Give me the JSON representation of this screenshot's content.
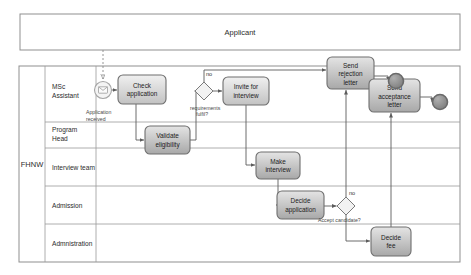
{
  "diagram": {
    "type": "bpmn-collaboration"
  },
  "pools": [
    {
      "id": "applicant",
      "label": "Applicant",
      "x": 20,
      "y": 14,
      "w": 440,
      "h": 36
    },
    {
      "id": "fhnw",
      "label": "FHNW",
      "x": 19,
      "y": 66,
      "w": 441,
      "h": 196
    }
  ],
  "lanes": [
    {
      "id": "msc-assistant",
      "label": "MSc\nAssistant",
      "label_lines": [
        "MSc",
        "Assistant"
      ],
      "y": 66,
      "h": 56
    },
    {
      "id": "program-head",
      "label": "Program\nHead",
      "label_lines": [
        "Program",
        "Head"
      ],
      "y": 122,
      "h": 26
    },
    {
      "id": "interview-team",
      "label": "Interview team",
      "label_lines": [
        "Interview team"
      ],
      "y": 148,
      "h": 38
    },
    {
      "id": "admission",
      "label": "Admission",
      "label_lines": [
        "Admission"
      ],
      "y": 186,
      "h": 38
    },
    {
      "id": "administration",
      "label": "Admnistration",
      "label_lines": [
        "Admnistration"
      ],
      "y": 224,
      "h": 38
    }
  ],
  "events": [
    {
      "id": "application-received",
      "kind": "message-start-event",
      "label": "Application\nreceived",
      "label_lines": [
        "Application",
        "received"
      ],
      "cx": 103,
      "cy": 90,
      "r": 8.5
    },
    {
      "id": "end-rejection",
      "kind": "end-event",
      "label": "",
      "cx": 396,
      "cy": 81,
      "r": 7.5,
      "fill": "#8a8a8a"
    },
    {
      "id": "end-acceptance",
      "kind": "end-event",
      "label": "",
      "cx": 440,
      "cy": 102,
      "r": 7.5,
      "fill": "#8a8a8a"
    }
  ],
  "tasks": [
    {
      "id": "check-application",
      "label_lines": [
        "Check",
        "application"
      ],
      "x": 118,
      "y": 75,
      "w": 48,
      "h": 29,
      "fill": "#dcdcdc"
    },
    {
      "id": "validate-eligibility",
      "label_lines": [
        "Validate",
        "eligibility"
      ],
      "x": 145,
      "y": 126,
      "w": 45,
      "h": 28,
      "fill": "#c9c9c9"
    },
    {
      "id": "invite-for-interview",
      "label_lines": [
        "Invite for",
        "interview"
      ],
      "x": 223,
      "y": 77,
      "w": 46,
      "h": 28,
      "fill": "#dcdcdc"
    },
    {
      "id": "make-interview",
      "label_lines": [
        "Make",
        "interview"
      ],
      "x": 256,
      "y": 152,
      "w": 44,
      "h": 27,
      "fill": "#cfcfcf"
    },
    {
      "id": "decide-application",
      "label_lines": [
        "Decide",
        "application"
      ],
      "x": 277,
      "y": 191,
      "w": 47,
      "h": 28,
      "fill": "#b9b9b9"
    },
    {
      "id": "send-rejection-letter",
      "label_lines": [
        "Send",
        "rejection",
        "letter"
      ],
      "x": 327,
      "y": 57,
      "w": 47,
      "h": 32,
      "fill": "#c4c4c4"
    },
    {
      "id": "send-acceptance-letter",
      "label_lines": [
        "Send",
        "acceptance",
        "letter"
      ],
      "x": 369,
      "y": 79,
      "w": 51,
      "h": 33,
      "fill": "#c0c0c0"
    },
    {
      "id": "decide-fee",
      "label_lines": [
        "Decide",
        "fee"
      ],
      "x": 371,
      "y": 227,
      "w": 40,
      "h": 29,
      "fill": "#b3b3b3"
    }
  ],
  "gateways": [
    {
      "id": "requirements-gateway",
      "label_lines": [
        "requirements",
        "fulfil?"
      ],
      "cx": 204,
      "cy": 91,
      "size": 9
    },
    {
      "id": "accept-candidate-gateway",
      "label_lines": [
        "Accept candidate?"
      ],
      "cx": 346,
      "cy": 206,
      "size": 9
    }
  ],
  "edge_labels": [
    {
      "id": "no-requirements",
      "text": "no",
      "x": 206,
      "y": 76
    },
    {
      "id": "no-accept",
      "text": "no",
      "x": 350,
      "y": 195
    }
  ],
  "colors": {
    "pool_stroke": "#8f8f8f",
    "lane_stroke": "#9a9a9a",
    "flow_stroke": "#5c5c5c",
    "task_stroke": "#6e6e6e",
    "end_event_fill": "#8a8a8a",
    "text": "#1c1c1c",
    "background": "#ffffff"
  }
}
